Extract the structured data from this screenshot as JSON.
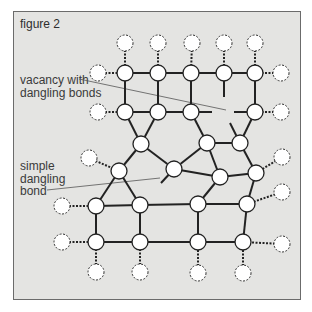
{
  "figure": {
    "title": "figure 2",
    "background": "#e4e4e2",
    "atom_fill": "#ffffff",
    "bond_color": "#222222"
  },
  "annotations": {
    "vacancy_label_line1": "vacancy with",
    "vacancy_label_line2": "dangling bonds",
    "simple_label_line1": "simple",
    "simple_label_line2": "dangling",
    "simple_label_line3": "bond"
  },
  "atoms": [
    {
      "id": "a1",
      "x": 125,
      "y": 73
    },
    {
      "id": "a2",
      "x": 158,
      "y": 73
    },
    {
      "id": "a3",
      "x": 191,
      "y": 73
    },
    {
      "id": "a4",
      "x": 224,
      "y": 73
    },
    {
      "id": "a5",
      "x": 255,
      "y": 73
    },
    {
      "id": "b1",
      "x": 125,
      "y": 112
    },
    {
      "id": "b2",
      "x": 158,
      "y": 112
    },
    {
      "id": "b3",
      "x": 191,
      "y": 112
    },
    {
      "id": "b5",
      "x": 255,
      "y": 112
    },
    {
      "id": "c1",
      "x": 141,
      "y": 144
    },
    {
      "id": "c2",
      "x": 207,
      "y": 143
    },
    {
      "id": "c3",
      "x": 240,
      "y": 143
    },
    {
      "id": "d1",
      "x": 119,
      "y": 171
    },
    {
      "id": "d2",
      "x": 174,
      "y": 169
    },
    {
      "id": "d3",
      "x": 220,
      "y": 177
    },
    {
      "id": "d4",
      "x": 256,
      "y": 173
    },
    {
      "id": "e1",
      "x": 96,
      "y": 206
    },
    {
      "id": "e2",
      "x": 140,
      "y": 205
    },
    {
      "id": "e3",
      "x": 198,
      "y": 204
    },
    {
      "id": "e4",
      "x": 247,
      "y": 204
    },
    {
      "id": "f1",
      "x": 96,
      "y": 242
    },
    {
      "id": "f2",
      "x": 140,
      "y": 242
    },
    {
      "id": "f3",
      "x": 198,
      "y": 242
    },
    {
      "id": "f4",
      "x": 243,
      "y": 242
    }
  ],
  "hydrogens": [
    {
      "x": 125,
      "y": 43,
      "to": "a1"
    },
    {
      "x": 158,
      "y": 43,
      "to": "a2"
    },
    {
      "x": 192,
      "y": 43,
      "to": "a3"
    },
    {
      "x": 224,
      "y": 43,
      "to": "a4"
    },
    {
      "x": 255,
      "y": 43,
      "to": "a5"
    },
    {
      "x": 98,
      "y": 73,
      "to": "a1"
    },
    {
      "x": 98,
      "y": 112,
      "to": "b1"
    },
    {
      "x": 281,
      "y": 73,
      "to": "a5"
    },
    {
      "x": 281,
      "y": 112,
      "to": "b5"
    },
    {
      "x": 89,
      "y": 158,
      "to": "d1"
    },
    {
      "x": 282,
      "y": 157,
      "to": "d4"
    },
    {
      "x": 62,
      "y": 206,
      "to": "e1"
    },
    {
      "x": 62,
      "y": 242,
      "to": "f1"
    },
    {
      "x": 282,
      "y": 192,
      "to": "e4"
    },
    {
      "x": 282,
      "y": 244,
      "to": "f4"
    },
    {
      "x": 96,
      "y": 272,
      "to": "f1"
    },
    {
      "x": 140,
      "y": 272,
      "to": "f2"
    },
    {
      "x": 198,
      "y": 273,
      "to": "f3"
    },
    {
      "x": 243,
      "y": 273,
      "to": "f4"
    }
  ],
  "bonds": [
    [
      "a1",
      "a2"
    ],
    [
      "a2",
      "a3"
    ],
    [
      "a3",
      "a4"
    ],
    [
      "a4",
      "a5"
    ],
    [
      "a1",
      "b1"
    ],
    [
      "a2",
      "b2"
    ],
    [
      "a3",
      "b3"
    ],
    [
      "a5",
      "b5"
    ],
    [
      "b1",
      "b2"
    ],
    [
      "b2",
      "b3"
    ],
    [
      "b1",
      "c1"
    ],
    [
      "b2",
      "c1"
    ],
    [
      "b3",
      "c2"
    ],
    [
      "c2",
      "c3"
    ],
    [
      "b5",
      "c3"
    ],
    [
      "c1",
      "d1"
    ],
    [
      "c1",
      "d2"
    ],
    [
      "c2",
      "d2"
    ],
    [
      "c2",
      "d3"
    ],
    [
      "d2",
      "d3"
    ],
    [
      "d3",
      "d4"
    ],
    [
      "c3",
      "d4"
    ],
    [
      "d1",
      "e1"
    ],
    [
      "d1",
      "e2"
    ],
    [
      "d3",
      "e3"
    ],
    [
      "d4",
      "e4"
    ],
    [
      "e1",
      "e2"
    ],
    [
      "e2",
      "e3"
    ],
    [
      "e3",
      "e4"
    ],
    [
      "e1",
      "f1"
    ],
    [
      "e2",
      "f2"
    ],
    [
      "e3",
      "f3"
    ],
    [
      "e4",
      "f4"
    ],
    [
      "f1",
      "f2"
    ],
    [
      "f2",
      "f3"
    ],
    [
      "f3",
      "f4"
    ]
  ],
  "dangling": [
    {
      "x1": 224,
      "y1": 73,
      "x2": 224,
      "y2": 97
    },
    {
      "x1": 191,
      "y1": 112,
      "x2": 212,
      "y2": 112
    },
    {
      "x1": 255,
      "y1": 112,
      "x2": 234,
      "y2": 112
    },
    {
      "x1": 240,
      "y1": 143,
      "x2": 230,
      "y2": 123
    },
    {
      "x1": 174,
      "y1": 169,
      "x2": 161,
      "y2": 183
    }
  ],
  "leaders": [
    {
      "x1": 79,
      "y1": 79,
      "x2": 226,
      "y2": 110
    },
    {
      "x1": 47,
      "y1": 190,
      "x2": 160,
      "y2": 178
    }
  ]
}
